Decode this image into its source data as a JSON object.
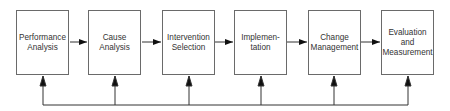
{
  "diagram": {
    "type": "process-flow",
    "steps": [
      {
        "label": "Performance\nAnalysis"
      },
      {
        "label": "Cause\nAnalysis"
      },
      {
        "label": "Intervention\nSelection"
      },
      {
        "label": "Implemen-\ntation"
      },
      {
        "label": "Change\nManagement"
      },
      {
        "label": "Evaluation\nand\nMeasurement"
      }
    ],
    "connections": "Sequential arrows between steps; feedback line along bottom with upward arrows into every step",
    "colors": {
      "line": "#1a1a1a",
      "border": "#6a6a6a",
      "text": "#333333"
    }
  }
}
